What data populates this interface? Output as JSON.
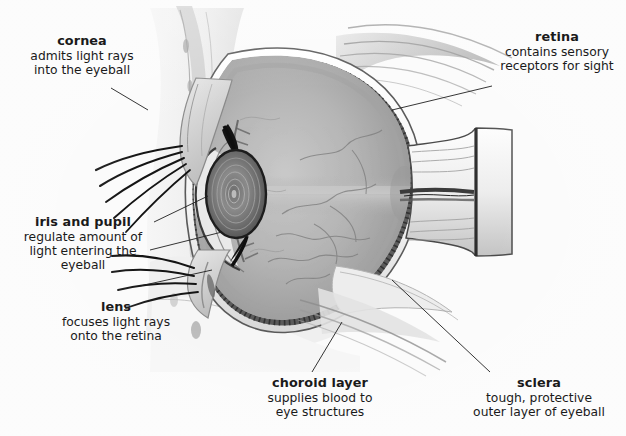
{
  "figure": {
    "background_color": "#fbfbfb",
    "ink_color": "#1a1a1a",
    "style": "grayscale anatomical illustration"
  },
  "labels": [
    {
      "id": "cornea",
      "title": "cornea",
      "description": "admits light rays\ninto the eyeball"
    },
    {
      "id": "iris-and-pupil",
      "title": "iris and pupil",
      "description": "regulate amount of\nlight entering the\neyeball"
    },
    {
      "id": "lens",
      "title": "lens",
      "description": "focuses light rays\nonto the retina"
    },
    {
      "id": "retina",
      "title": "retina",
      "description": "contains sensory\nreceptors for sight"
    },
    {
      "id": "choroid-layer",
      "title": "choroid layer",
      "description": "supplies blood to\neye structures"
    },
    {
      "id": "sclera",
      "title": "sclera",
      "description": "tough, protective\nouter layer of eyeball"
    }
  ]
}
